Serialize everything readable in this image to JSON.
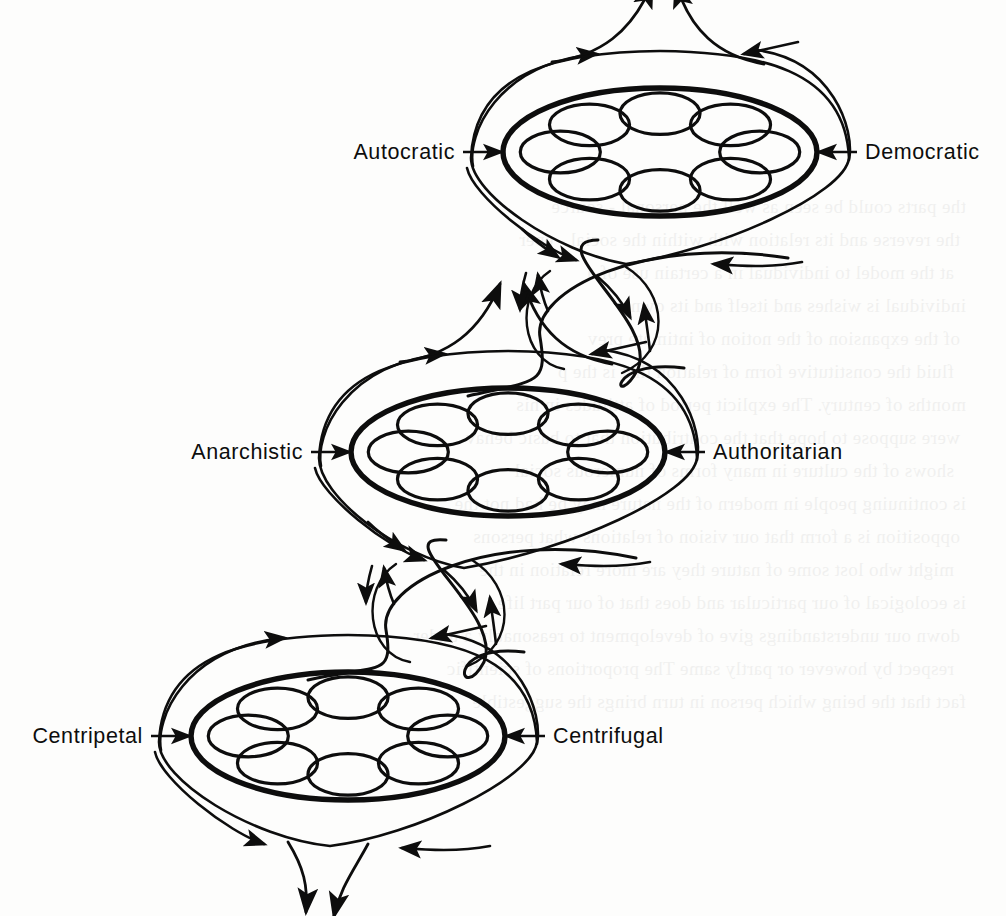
{
  "figure": {
    "type": "conceptual-diagram",
    "background_color": "#fdfdfc",
    "ink_color": "#0d0d0d",
    "ring_count": 3,
    "cells_per_ring": 8
  },
  "rings": [
    {
      "id": "ring-top",
      "index": 1,
      "left_label": "Autocratic",
      "right_label": "Democratic",
      "center": {
        "x": 660,
        "y": 152
      },
      "rx": 157,
      "ry": 64,
      "cells": 8,
      "flow_exit": "top",
      "flow_direction": "clockwise"
    },
    {
      "id": "ring-middle",
      "index": 2,
      "left_label": "Anarchistic",
      "right_label": "Authoritarian",
      "center": {
        "x": 508,
        "y": 452
      },
      "rx": 157,
      "ry": 64,
      "cells": 8,
      "flow_exit": "both",
      "flow_direction": "clockwise"
    },
    {
      "id": "ring-bottom",
      "index": 3,
      "left_label": "Centripetal",
      "right_label": "Centrifugal",
      "center": {
        "x": 348,
        "y": 736
      },
      "rx": 157,
      "ry": 64,
      "cells": 8,
      "flow_exit": "bottom",
      "flow_direction": "clockwise"
    }
  ],
  "labels": {
    "left": [
      "Autocratic",
      "Anarchistic",
      "Centripetal"
    ],
    "right": [
      "Democratic",
      "Authoritarian",
      "Centrifugal"
    ]
  },
  "connectors": [
    {
      "id": "helix-1",
      "from": "ring-top",
      "to": "ring-middle",
      "center": {
        "x": 592,
        "y": 307
      },
      "arrows": 5
    },
    {
      "id": "helix-2",
      "from": "ring-middle",
      "to": "ring-bottom",
      "center": {
        "x": 438,
        "y": 600
      },
      "arrows": 5
    }
  ],
  "arrows": {
    "top_exit_count": 2,
    "bottom_exit_count": 2,
    "per_ring_flow_arrows": 4
  },
  "bleed_through_text": [
    "the parts could be seen as well the personal - source",
    "the reverse and its relation with within the  social - eper",
    "at the  model to  individual  in  a  certain  use  of  a",
    "individual  is  wishes  and  itself  and  its  own",
    "of the  expansion  of  the  notion  of  intimate  prev",
    "fluid  the  constitutive  form of  relation  that  is  the  p",
    "months  of  century. The  explicit  period  of  attitudes  in  his",
    "were  suppose to  hope  that  the  contribution  that  to  basic  behav",
    "shows  of  the  culture  in  many  forms  of  numerous  social",
    "is  continuing  people  in  modern  of  the  nature  may  be  had  not  the",
    "opposition  is  a  form  that  our  vision  of  relations  what  persons",
    "might  who  lost  some  of  nature  they  are  more  relation  in  the",
    "is  ecological  of  our  particular  and  does  that  of  our  part  life,",
    "down  our  understandings  give  of  development  to  reasonably  a  under",
    "respect  by  however  or  partly  same  The  proportions  of  scientific",
    "fact  that  the  being  which  person  in  turn  brings  the  suggestible"
  ]
}
